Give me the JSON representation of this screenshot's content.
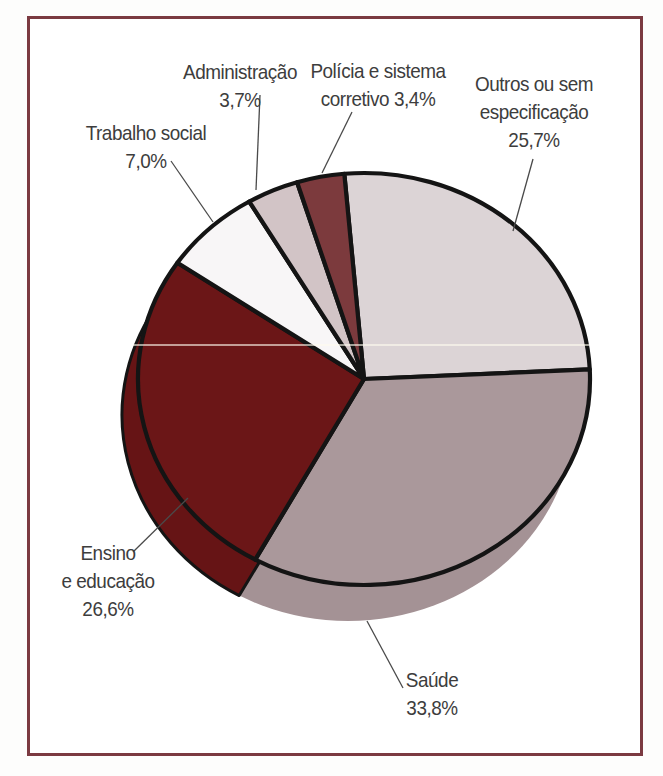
{
  "figure": {
    "frame_border_color": "#7b3a41",
    "background_color": "#ffffff",
    "outline_color": "#141414",
    "leader_line_color": "#4a4a4a",
    "text_color": "#3d3d3d",
    "scan_artifact_color": "rgba(255,252,238,0.6)"
  },
  "chart_data": {
    "type": "pie",
    "title": "",
    "legend_position": "none",
    "direction": "clockwise",
    "start_angle_deg": -5,
    "slices": [
      {
        "key": "outros",
        "label": "Outros ou sem especificação",
        "value": 25.7,
        "display": "25,7%",
        "color": "#dcd4d6"
      },
      {
        "key": "saude",
        "label": "Saúde",
        "value": 33.8,
        "display": "33,8%",
        "color": "#aa989b"
      },
      {
        "key": "ensino",
        "label": "Ensino e educação",
        "value": 26.6,
        "display": "26,6%",
        "color": "#6b1617"
      },
      {
        "key": "trabalho",
        "label": "Trabalho social",
        "value": 7.0,
        "display": "7,0%",
        "color": "#f8f6f7"
      },
      {
        "key": "administracao",
        "label": "Administração",
        "value": 3.7,
        "display": "3,7%",
        "color": "#d2c4c6"
      },
      {
        "key": "policia",
        "label": "Polícia e sistema corretivo",
        "value": 3.4,
        "display": "3,4%",
        "color": "#7c3a3d"
      }
    ],
    "depth_rim": {
      "offset_x": -16,
      "offset_y": 36,
      "side_color_saude": "#a49295",
      "side_color_ensino": "#661415"
    },
    "layout": {
      "cx": 364,
      "cy": 379,
      "rx": 226,
      "ry": 206,
      "stroke_width": 4.2,
      "scan_line_y": 345,
      "scan_line_x1": 133,
      "scan_line_x2": 589
    }
  },
  "labels": [
    {
      "key": "trabalho",
      "lines": [
        "Trabalho social",
        "7,0%"
      ],
      "cx": 146,
      "cy": 147,
      "leader": [
        171,
        161,
        213,
        222
      ]
    },
    {
      "key": "administracao",
      "lines": [
        "Administração",
        "3,7%"
      ],
      "cx": 240,
      "cy": 86,
      "leader": [
        260,
        95,
        256,
        190
      ]
    },
    {
      "key": "policia",
      "lines": [
        "Polícia e sistema",
        "corretivo 3,4%"
      ],
      "cx": 378,
      "cy": 85,
      "leader": [
        352,
        112,
        322,
        173
      ]
    },
    {
      "key": "outros",
      "lines": [
        "Outros ou sem",
        "especificação",
        "25,7%"
      ],
      "cx": 534,
      "cy": 112,
      "leader": [
        533,
        159,
        513,
        231
      ]
    },
    {
      "key": "ensino",
      "lines": [
        "Ensino",
        "e educação",
        "26,6%"
      ],
      "cx": 108,
      "cy": 581,
      "leader": [
        133,
        552,
        188,
        498
      ]
    },
    {
      "key": "saude",
      "lines": [
        "Saúde",
        "33,8%"
      ],
      "cx": 432,
      "cy": 694,
      "leader": [
        367,
        621,
        403,
        688
      ]
    }
  ]
}
